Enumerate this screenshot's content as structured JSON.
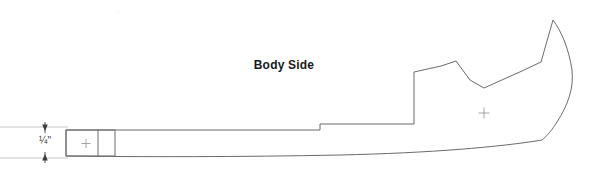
{
  "drawing": {
    "title": "Body Side",
    "background_color": "#ffffff",
    "outline_color": "#6b6b6b",
    "text_color": "#1a1a1a",
    "dimension_color": "#3a3a3a",
    "crosshair_color": "#9a9a9a",
    "units": "inches"
  },
  "dimension": {
    "label": "¼\"",
    "value": 0.25,
    "unit": "in",
    "measures": "tab-height",
    "orientation": "vertical",
    "arrow_top_y": 123,
    "arrow_bottom_y": 160,
    "extension_line_x_start": 0,
    "extension_line_x_end": 68
  },
  "tab": {
    "name": "alignment-tab",
    "left": 66,
    "top": 130,
    "right": 115,
    "bottom": 156,
    "divider_x": 98,
    "crosshair": {
      "x": 86,
      "y": 144,
      "size": 9
    }
  },
  "body": {
    "name": "body-side-outline",
    "crosshair": {
      "x": 484,
      "y": 113,
      "size": 11
    },
    "outline_points": [
      [
        66,
        130
      ],
      [
        320,
        130
      ],
      [
        320,
        124
      ],
      [
        414,
        124
      ],
      [
        414,
        118
      ],
      [
        414,
        72
      ],
      [
        440,
        66
      ],
      [
        455,
        62
      ],
      [
        470,
        80
      ],
      [
        483,
        88
      ],
      [
        520,
        72
      ],
      [
        540,
        62
      ],
      [
        553,
        20
      ],
      [
        566,
        45
      ],
      [
        572,
        70
      ],
      [
        568,
        95
      ],
      [
        556,
        120
      ],
      [
        548,
        132
      ],
      [
        540,
        140
      ]
    ],
    "bottom_curve": {
      "from": [
        556,
        141
      ],
      "control_1": [
        480,
        168
      ],
      "control_2": [
        300,
        158
      ],
      "to": [
        66,
        156
      ]
    },
    "description": "Long tapering body side pattern with stepped lower profile, V-notch on upper edge, and peaked right end"
  }
}
